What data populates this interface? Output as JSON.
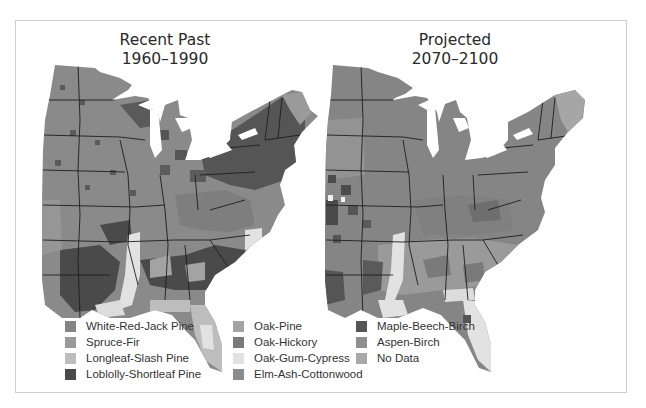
{
  "figure": {
    "panels": [
      {
        "title_line1": "Recent Past",
        "title_line2": "1960–1990"
      },
      {
        "title_line1": "Projected",
        "title_line2": "2070–2100"
      }
    ]
  },
  "legend": {
    "items": [
      {
        "label": "White-Red-Jack Pine",
        "color": "#858585"
      },
      {
        "label": "Spruce-Fir",
        "color": "#999999"
      },
      {
        "label": "Longleaf-Slash Pine",
        "color": "#bdbdbd"
      },
      {
        "label": "Loblolly-Shortleaf Pine",
        "color": "#4a4a4a"
      },
      {
        "label": "Oak-Pine",
        "color": "#a3a3a3"
      },
      {
        "label": "Oak-Hickory",
        "color": "#7a7a7a"
      },
      {
        "label": "Oak-Gum-Cypress",
        "color": "#e2e2e2"
      },
      {
        "label": "Elm-Ash-Cottonwood",
        "color": "#8c8c8c"
      },
      {
        "label": "Maple-Beech-Birch",
        "color": "#555555"
      },
      {
        "label": "Aspen-Birch",
        "color": "#8f8f8f"
      },
      {
        "label": "No Data",
        "color": "#a8a8a8"
      }
    ]
  },
  "colors": {
    "frame_border": "#cfcfcf",
    "state_lines": "#1e1e1e",
    "water": "#ffffff"
  }
}
